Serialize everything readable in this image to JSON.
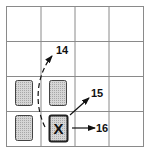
{
  "diagram": {
    "grid": {
      "rows": 4,
      "cols": 4,
      "line_color": "#8a8a8a"
    },
    "pieces": [
      {
        "id": "piece-r3c1",
        "row": 3,
        "col": 1,
        "shaded": true
      },
      {
        "id": "piece-r3c2",
        "row": 3,
        "col": 2,
        "shaded": true
      },
      {
        "id": "piece-r4c1",
        "row": 4,
        "col": 1,
        "shaded": true
      },
      {
        "id": "piece-r4c2",
        "row": 4,
        "col": 2,
        "shaded": true,
        "marker": "X"
      }
    ],
    "arrows": [
      {
        "label": "14",
        "style": "dashed-curve",
        "direction": "up"
      },
      {
        "label": "15",
        "style": "solid",
        "direction": "up-right"
      },
      {
        "label": "16",
        "style": "solid",
        "direction": "right"
      }
    ],
    "colors": {
      "shade": "#c8c8c8",
      "outline": "#333333",
      "ink": "#111111"
    }
  }
}
